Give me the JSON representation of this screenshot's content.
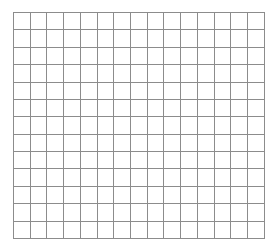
{
  "page": {
    "width": 279,
    "height": 251,
    "background_color": "#ffffff",
    "caption": ""
  },
  "grid": {
    "name": "empty-grid-table",
    "columns": 15,
    "rows": 13,
    "cell_width_px": 16.8,
    "cell_height_px": 17.38,
    "origin_x_px": 13,
    "origin_y_px": 12,
    "width_px": 252,
    "height_px": 226,
    "line_color": "#8c8c8c",
    "line_width_px": 1,
    "cell_background": "#ffffff",
    "cells_empty": true,
    "cells": [
      [
        "",
        "",
        "",
        "",
        "",
        "",
        "",
        "",
        "",
        "",
        "",
        "",
        "",
        "",
        ""
      ],
      [
        "",
        "",
        "",
        "",
        "",
        "",
        "",
        "",
        "",
        "",
        "",
        "",
        "",
        "",
        ""
      ],
      [
        "",
        "",
        "",
        "",
        "",
        "",
        "",
        "",
        "",
        "",
        "",
        "",
        "",
        "",
        ""
      ],
      [
        "",
        "",
        "",
        "",
        "",
        "",
        "",
        "",
        "",
        "",
        "",
        "",
        "",
        "",
        ""
      ],
      [
        "",
        "",
        "",
        "",
        "",
        "",
        "",
        "",
        "",
        "",
        "",
        "",
        "",
        "",
        ""
      ],
      [
        "",
        "",
        "",
        "",
        "",
        "",
        "",
        "",
        "",
        "",
        "",
        "",
        "",
        "",
        ""
      ],
      [
        "",
        "",
        "",
        "",
        "",
        "",
        "",
        "",
        "",
        "",
        "",
        "",
        "",
        "",
        ""
      ],
      [
        "",
        "",
        "",
        "",
        "",
        "",
        "",
        "",
        "",
        "",
        "",
        "",
        "",
        "",
        ""
      ],
      [
        "",
        "",
        "",
        "",
        "",
        "",
        "",
        "",
        "",
        "",
        "",
        "",
        "",
        "",
        ""
      ],
      [
        "",
        "",
        "",
        "",
        "",
        "",
        "",
        "",
        "",
        "",
        "",
        "",
        "",
        "",
        ""
      ],
      [
        "",
        "",
        "",
        "",
        "",
        "",
        "",
        "",
        "",
        "",
        "",
        "",
        "",
        "",
        ""
      ],
      [
        "",
        "",
        "",
        "",
        "",
        "",
        "",
        "",
        "",
        "",
        "",
        "",
        "",
        "",
        ""
      ],
      [
        "",
        "",
        "",
        "",
        "",
        "",
        "",
        "",
        "",
        "",
        "",
        "",
        "",
        "",
        ""
      ]
    ]
  }
}
